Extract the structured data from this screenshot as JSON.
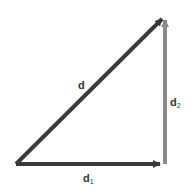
{
  "diagram": {
    "type": "vector-addition",
    "colors": {
      "dark": "#3a3a3a",
      "gray": "#8a8a8a"
    },
    "vectors": [
      {
        "id": "d",
        "label": "d",
        "sub": "",
        "from": [
          16,
          164
        ],
        "to": [
          163,
          18
        ],
        "color": "#3a3a3a"
      },
      {
        "id": "d1",
        "label": "d",
        "sub": "1",
        "from": [
          16,
          164
        ],
        "to": [
          163,
          164
        ],
        "color": "#3a3a3a"
      },
      {
        "id": "d2",
        "label": "d",
        "sub": "2",
        "from": [
          165,
          164
        ],
        "to": [
          165,
          18
        ],
        "color": "#8a8a8a"
      }
    ]
  }
}
